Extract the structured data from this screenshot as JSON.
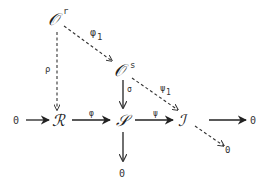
{
  "diagram": {
    "type": "commutative-diagram",
    "nodes": {
      "O_r": {
        "symbol": "𝒪",
        "superscript": "r"
      },
      "O_s": {
        "symbol": "𝒪",
        "superscript": "s"
      },
      "zero_left": {
        "symbol": "0"
      },
      "R": {
        "symbol": "ℛ"
      },
      "S": {
        "symbol": "𝒮"
      },
      "J": {
        "symbol": "ℐ"
      },
      "zero_right": {
        "symbol": "0"
      },
      "zero_below_S": {
        "symbol": "0"
      },
      "zero_diag": {
        "symbol": "0"
      }
    },
    "arrows": {
      "phi1": {
        "label": "φ",
        "subscript": "1",
        "from": "O_r",
        "to": "O_s",
        "style": "dashed"
      },
      "rho": {
        "label": "ρ",
        "from": "O_r",
        "to": "R",
        "style": "dashed"
      },
      "sigma": {
        "label": "σ",
        "from": "O_s",
        "to": "S",
        "style": "solid"
      },
      "psi1": {
        "label": "ψ",
        "subscript": "1",
        "from": "O_s",
        "to": "J",
        "style": "dashed"
      },
      "zero_to_R": {
        "label": "",
        "from": "zero_left",
        "to": "R",
        "style": "solid"
      },
      "phi": {
        "label": "φ",
        "from": "R",
        "to": "S",
        "style": "solid"
      },
      "psi": {
        "label": "ψ",
        "from": "S",
        "to": "J",
        "style": "solid"
      },
      "J_to_zero": {
        "label": "",
        "from": "J",
        "to": "zero_right",
        "style": "solid"
      },
      "S_to_zero": {
        "label": "",
        "from": "S",
        "to": "zero_below_S",
        "style": "solid"
      },
      "J_to_zero_diag": {
        "label": "",
        "from": "J",
        "to": "zero_diag",
        "style": "dashed"
      }
    }
  }
}
